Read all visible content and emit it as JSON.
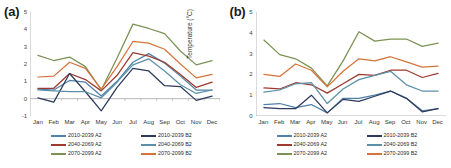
{
  "figure": {
    "panels": [
      {
        "label": "(a)",
        "ylabel": "Temperature (°C)",
        "chart_index": 0
      },
      {
        "label": "(b)",
        "ylabel": "Temperature (°C)",
        "chart_index": 1
      }
    ]
  },
  "colors": {
    "series_2010_2039_A2": "#4f81a8",
    "series_2040_2069_A2": "#9c3a30",
    "series_2070_2099_A2": "#7a9253",
    "series_2010_2039_B2": "#2e3a5c",
    "series_2040_2069_B2": "#5b8fa8",
    "series_2070_2099_B2": "#d4743a",
    "axis": "#9a9a9a",
    "text": "#333333",
    "background": "#ffffff"
  },
  "chart_data": [
    {
      "type": "line",
      "title": "(a)",
      "xlabel": "",
      "ylabel": "Temperature (°C)",
      "categories": [
        "Jan",
        "Feb",
        "Mar",
        "Apr",
        "May",
        "Jun",
        "Jul",
        "Aug",
        "Sep",
        "Oct",
        "Nov",
        "Dec"
      ],
      "ylim": [
        -1,
        5
      ],
      "yticks": [
        -1,
        0,
        1,
        2,
        3,
        4,
        5
      ],
      "grid": false,
      "legend_position": "bottom",
      "series": [
        {
          "name": "2010-2039 A2",
          "color": "#4f81a8",
          "values": [
            0.55,
            0.5,
            1.05,
            0.95,
            0.15,
            1.0,
            2.1,
            2.6,
            2.05,
            1.3,
            0.5,
            0.5
          ]
        },
        {
          "name": "2040-2069 A2",
          "color": "#9c3a30",
          "values": [
            0.6,
            0.6,
            1.45,
            1.1,
            0.45,
            1.35,
            2.65,
            2.45,
            2.1,
            1.4,
            0.65,
            0.95
          ]
        },
        {
          "name": "2070-2099 A2",
          "color": "#7a9253",
          "values": [
            2.5,
            2.2,
            2.4,
            1.85,
            0.5,
            2.35,
            4.3,
            4.05,
            3.75,
            2.75,
            1.95,
            2.2
          ]
        },
        {
          "name": "2010-2039 B2",
          "color": "#2e3a5c",
          "values": [
            0.05,
            -0.2,
            1.45,
            0.4,
            -0.7,
            0.65,
            1.75,
            1.6,
            0.75,
            0.7,
            -0.1,
            0.15
          ]
        },
        {
          "name": "2040-2069 B2",
          "color": "#5b8fa8",
          "values": [
            0.5,
            0.45,
            0.4,
            0.4,
            0.05,
            0.95,
            1.95,
            2.3,
            1.6,
            0.8,
            0.3,
            0.5
          ]
        },
        {
          "name": "2070-2099 B2",
          "color": "#d4743a",
          "values": [
            1.25,
            1.3,
            2.1,
            1.75,
            0.55,
            1.85,
            3.3,
            3.2,
            2.85,
            2.0,
            1.2,
            1.4
          ]
        }
      ]
    },
    {
      "type": "line",
      "title": "(b)",
      "xlabel": "",
      "ylabel": "Temperature (°C)",
      "categories": [
        "Jan",
        "Feb",
        "Mar",
        "Apr",
        "May",
        "Jun",
        "Jul",
        "Aug",
        "Sep",
        "Oct",
        "Nov",
        "Dec"
      ],
      "ylim": [
        0,
        5
      ],
      "yticks": [
        0,
        1,
        2,
        3,
        4,
        5
      ],
      "grid": false,
      "legend_position": "bottom",
      "series": [
        {
          "name": "2010-2039 A2",
          "color": "#4f81a8",
          "values": [
            0.55,
            0.6,
            0.4,
            0.55,
            0.15,
            0.85,
            0.85,
            1.0,
            1.2,
            0.85,
            0.25,
            0.35
          ]
        },
        {
          "name": "2040-2069 A2",
          "color": "#9c3a30",
          "values": [
            1.35,
            1.3,
            1.6,
            1.5,
            1.1,
            1.55,
            2.0,
            1.95,
            2.2,
            2.2,
            1.85,
            2.05
          ]
        },
        {
          "name": "2070-2099 A2",
          "color": "#7a9253",
          "values": [
            3.65,
            2.95,
            2.75,
            2.3,
            1.45,
            2.65,
            4.05,
            3.6,
            3.7,
            3.7,
            3.35,
            3.5
          ]
        },
        {
          "name": "2010-2039 B2",
          "color": "#2e3a5c",
          "values": [
            0.4,
            0.35,
            0.35,
            1.0,
            0.15,
            0.8,
            0.7,
            0.95,
            1.2,
            0.85,
            0.2,
            0.35
          ]
        },
        {
          "name": "2040-2069 B2",
          "color": "#5b8fa8",
          "values": [
            1.15,
            1.25,
            1.55,
            1.6,
            0.6,
            1.3,
            1.75,
            1.95,
            2.15,
            1.5,
            1.2,
            1.2
          ]
        },
        {
          "name": "2070-2099 B2",
          "color": "#d4743a",
          "values": [
            2.0,
            1.9,
            2.5,
            2.2,
            1.4,
            2.15,
            2.75,
            2.65,
            2.85,
            2.6,
            2.35,
            2.4
          ]
        }
      ]
    }
  ],
  "legend": {
    "items": [
      {
        "label": "2010-2039 A2",
        "color": "#4f81a8"
      },
      {
        "label": "2040-2069 A2",
        "color": "#9c3a30"
      },
      {
        "label": "2070-2099 A2",
        "color": "#7a9253"
      },
      {
        "label": "2010-2039 B2",
        "color": "#2e3a5c"
      },
      {
        "label": "2040-2069 B2",
        "color": "#5b8fa8"
      },
      {
        "label": "2070-2099 B2",
        "color": "#d4743a"
      }
    ]
  }
}
